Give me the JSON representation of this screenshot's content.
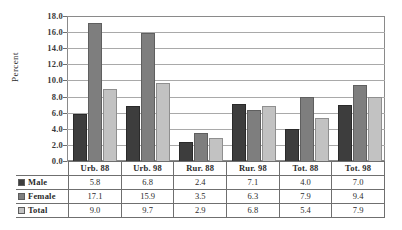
{
  "chart_data": {
    "type": "bar",
    "title": "",
    "xlabel": "",
    "ylabel": "Percent",
    "ylim": [
      0.0,
      18.0
    ],
    "ytick_step": 2.0,
    "yticks": [
      "18.0",
      "16.0",
      "14.0",
      "12.0",
      "10.0",
      "8.0",
      "6.0",
      "4.0",
      "2.0",
      "0.0"
    ],
    "grid": true,
    "legend_position": "table-left",
    "categories": [
      "Urb. 88",
      "Urb. 98",
      "Rur. 88",
      "Rur. 98",
      "Tot. 88",
      "Tot. 98"
    ],
    "series": [
      {
        "name": "Male",
        "color": "#3d3d3d",
        "values": [
          5.8,
          6.8,
          2.4,
          7.1,
          4.0,
          7.0
        ]
      },
      {
        "name": "Female",
        "color": "#7e7e7e",
        "values": [
          17.1,
          15.9,
          3.5,
          6.3,
          7.9,
          9.4
        ]
      },
      {
        "name": "Total",
        "color": "#c2c2c2",
        "values": [
          9.0,
          9.7,
          2.9,
          6.8,
          5.4,
          7.9
        ]
      }
    ],
    "table": {
      "row_labels": [
        "Male",
        "Female",
        "Total"
      ],
      "rows": [
        [
          "5.8",
          "6.8",
          "2.4",
          "7.1",
          "4.0",
          "7.0"
        ],
        [
          "17.1",
          "15.9",
          "3.5",
          "6.3",
          "7.9",
          "9.4"
        ],
        [
          "9.0",
          "9.7",
          "2.9",
          "6.8",
          "5.4",
          "7.9"
        ]
      ]
    }
  }
}
